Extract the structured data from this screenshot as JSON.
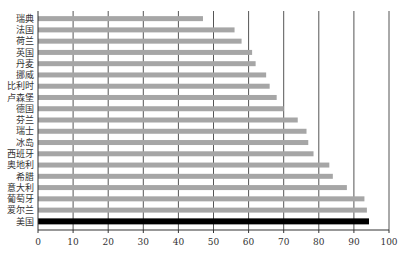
{
  "chart_data": {
    "type": "bar",
    "orientation": "horizontal",
    "title": "",
    "xlabel": "",
    "ylabel": "",
    "categories": [
      "瑞典",
      "法国",
      "荷兰",
      "英国",
      "丹麦",
      "挪威",
      "比利时",
      "卢森堡",
      "德国",
      "芬兰",
      "瑞士",
      "冰岛",
      "西班牙",
      "奥地利",
      "希腊",
      "意大利",
      "葡萄牙",
      "爱尔兰",
      "美国"
    ],
    "values": [
      47,
      56,
      58,
      61,
      62,
      65,
      66,
      68,
      70,
      74,
      76.5,
      77,
      78.5,
      83,
      84,
      88,
      93,
      93.7,
      94.3
    ],
    "highlight": {
      "category": "美国",
      "color": "#000000"
    },
    "bar_color": "#a6a6a6",
    "gridline_color": "#555555",
    "xlim": [
      0,
      100
    ],
    "xticks": [
      0,
      10,
      20,
      30,
      40,
      50,
      60,
      70,
      80,
      90,
      100
    ],
    "xtick_labels": [
      "0",
      "10",
      "20",
      "30",
      "40",
      "50",
      "60",
      "70",
      "80",
      "90",
      "100"
    ],
    "grid": "vertical",
    "legend": "none"
  }
}
